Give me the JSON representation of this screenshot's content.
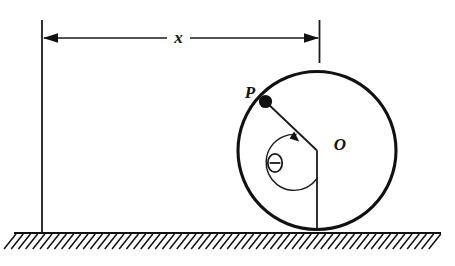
{
  "figure": {
    "background_color": "#ffffff",
    "line_color": "#111111",
    "width": 455,
    "height": 266
  },
  "labels": {
    "distance": "x",
    "point_on_rim": "P",
    "center": "O",
    "angle": "Θ"
  },
  "geometry": {
    "circle": {
      "center_x": 317,
      "center_y": 150.5,
      "radius": 79
    },
    "point_p": {
      "x": 265,
      "y": 101,
      "dot_radius": 6.5
    },
    "ground_line_y": 233,
    "ground_line_x_start": 14,
    "ground_line_x_end": 441,
    "left_reference_line_x": 42,
    "right_reference_line_x": 319,
    "reference_line_top_y": 20,
    "dimension_line_y": 38,
    "angle_arc_radius": 28
  },
  "elements": {
    "left_extension_line": "left-extension-line",
    "right_extension_line": "right-extension-line",
    "dimension_line": "dimension-line-x",
    "left_arrowhead": "left-arrowhead",
    "right_arrowhead": "right-arrowhead",
    "wheel": "wheel-circle",
    "radius_line": "radius-line-op",
    "center_vertical": "center-vertical-line",
    "angle_arc": "angle-arc-theta",
    "angle_arrowhead": "angle-arrowhead",
    "ground": "ground-line",
    "hatching": "ground-hatching"
  }
}
